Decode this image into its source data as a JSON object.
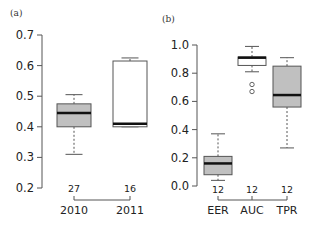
{
  "chart_data": [
    {
      "type": "box",
      "panel_label": "(a)",
      "title": "",
      "xlabel": "",
      "ylabel": "",
      "ylim": [
        0.2,
        0.7
      ],
      "yticks": [
        "0.7",
        "0.6",
        "0.5",
        "0.4",
        "0.3",
        "0.2"
      ],
      "categories": [
        "2010",
        "2011"
      ],
      "counts": [
        "27",
        "16"
      ],
      "boxes": [
        {
          "name": "2010",
          "whisker_low": 0.31,
          "q1": 0.4,
          "median": 0.445,
          "q3": 0.475,
          "whisker_high": 0.505,
          "fill": "#c0c0c0",
          "outliers": []
        },
        {
          "name": "2011",
          "whisker_low": 0.4,
          "q1": 0.4,
          "median": 0.41,
          "q3": 0.615,
          "whisker_high": 0.625,
          "fill": "#ffffff",
          "outliers": []
        }
      ],
      "grid": false
    },
    {
      "type": "box",
      "panel_label": "(b)",
      "title": "",
      "xlabel": "",
      "ylabel": "",
      "ylim": [
        0.0,
        1.0
      ],
      "yticks": [
        "1.0",
        "0.8",
        "0.6",
        "0.4",
        "0.2",
        "0.0"
      ],
      "categories": [
        "EER",
        "AUC",
        "TPR"
      ],
      "counts": [
        "12",
        "12",
        "12"
      ],
      "boxes": [
        {
          "name": "EER",
          "whisker_low": 0.04,
          "q1": 0.08,
          "median": 0.16,
          "q3": 0.21,
          "whisker_high": 0.37,
          "fill": "#c0c0c0",
          "outliers": []
        },
        {
          "name": "AUC",
          "whisker_low": 0.81,
          "q1": 0.855,
          "median": 0.91,
          "q3": 0.915,
          "whisker_high": 0.99,
          "fill": "#ffffff",
          "outliers": [
            0.72,
            0.67
          ]
        },
        {
          "name": "TPR",
          "whisker_low": 0.27,
          "q1": 0.56,
          "median": 0.645,
          "q3": 0.85,
          "whisker_high": 0.91,
          "fill": "#c0c0c0",
          "outliers": []
        }
      ],
      "grid": false
    }
  ]
}
